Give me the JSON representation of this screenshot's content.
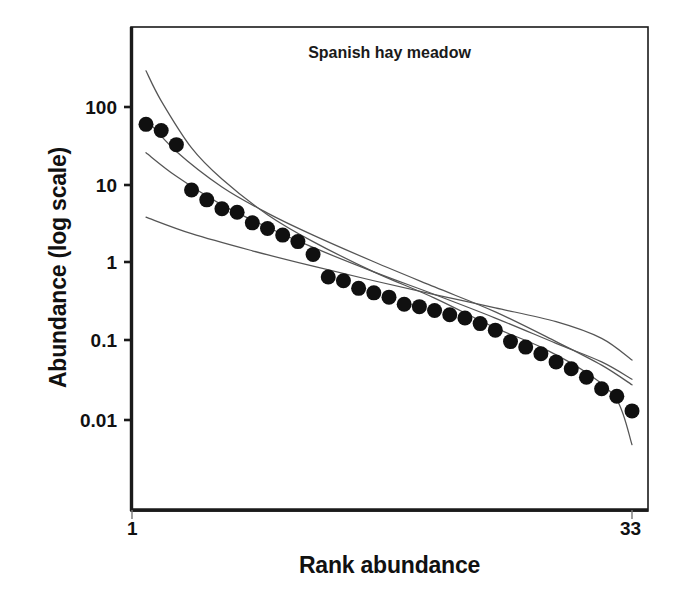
{
  "chart_data": {
    "type": "scatter",
    "title": "Spanish hay meadow",
    "xlabel": "Rank abundance",
    "ylabel": "Abundance (log scale)",
    "yscale": "log",
    "ylim": [
      0.0028,
      560
    ],
    "xlim": [
      1,
      33
    ],
    "grid": false,
    "legend": null,
    "ytick_labels": [
      "100",
      "10",
      "1",
      "0.1",
      "0.01"
    ],
    "ytick_values": [
      100,
      10,
      1,
      0.1,
      0.01
    ],
    "xtick_labels": [
      "1",
      "33"
    ],
    "xtick_values": [
      1,
      33
    ],
    "marker": {
      "shape": "filled-circle",
      "color": "#101010",
      "size_px": 15
    },
    "series": [
      {
        "name": "Observed rank abundance",
        "type": "scatter",
        "x": [
          1,
          2,
          3,
          4,
          5,
          6,
          7,
          8,
          9,
          10,
          11,
          12,
          13,
          14,
          15,
          16,
          17,
          18,
          19,
          20,
          21,
          22,
          23,
          24,
          25,
          26,
          27,
          28,
          29,
          30,
          31,
          32,
          33
        ],
        "values": [
          60,
          50,
          33,
          8.7,
          6.5,
          5.0,
          4.5,
          3.3,
          2.8,
          2.3,
          1.9,
          1.3,
          0.67,
          0.6,
          0.48,
          0.42,
          0.37,
          0.3,
          0.28,
          0.25,
          0.22,
          0.2,
          0.17,
          0.14,
          0.1,
          0.085,
          0.07,
          0.055,
          0.045,
          0.035,
          0.025,
          0.02,
          0.013
        ]
      },
      {
        "name": "Fitted model curve 1 (steep / geometric)",
        "type": "line",
        "color": "#555555",
        "x": [
          1,
          2,
          4,
          6,
          9,
          12,
          16,
          20,
          24,
          27,
          30,
          32,
          33
        ],
        "values": [
          290,
          120,
          30,
          12,
          4.2,
          1.9,
          0.78,
          0.36,
          0.15,
          0.085,
          0.04,
          0.018,
          0.0048
        ]
      },
      {
        "name": "Fitted model curve 2 (log-normal)",
        "type": "line",
        "color": "#555555",
        "x": [
          1,
          3,
          6,
          9,
          12,
          16,
          20,
          24,
          28,
          31,
          33
        ],
        "values": [
          70,
          27,
          9.5,
          4.4,
          2.3,
          1.05,
          0.5,
          0.24,
          0.1,
          0.05,
          0.028
        ]
      },
      {
        "name": "Fitted model curve 3 (broken stick)",
        "type": "line",
        "color": "#555555",
        "x": [
          1,
          3,
          6,
          9,
          12,
          16,
          20,
          24,
          28,
          31,
          33
        ],
        "values": [
          26,
          13,
          5.6,
          2.9,
          1.6,
          0.78,
          0.4,
          0.2,
          0.095,
          0.055,
          0.033
        ]
      },
      {
        "name": "Fitted model curve 4 (shallow / Zipf-Mandelbrot)",
        "type": "line",
        "color": "#555555",
        "x": [
          1,
          4,
          8,
          12,
          16,
          20,
          24,
          28,
          31,
          33
        ],
        "values": [
          3.9,
          2.4,
          1.45,
          0.92,
          0.6,
          0.4,
          0.27,
          0.18,
          0.11,
          0.058
        ]
      }
    ]
  },
  "axis": {
    "frame_color": "#1a1a1a"
  }
}
